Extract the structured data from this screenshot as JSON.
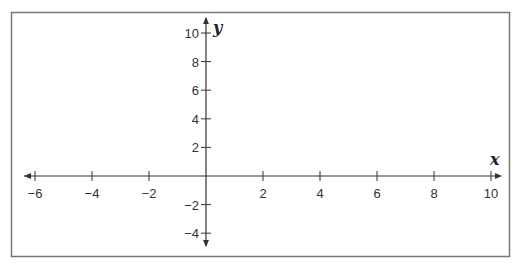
{
  "chart_data": {
    "type": "coordinate-plane",
    "title": "",
    "xlabel": "x",
    "ylabel": "y",
    "xlim": [
      -6,
      10
    ],
    "ylim": [
      -4,
      10
    ],
    "x_ticks": [
      -6,
      -4,
      -2,
      2,
      4,
      6,
      8,
      10
    ],
    "x_tick_labels": [
      "−6",
      "−4",
      "−2",
      "2",
      "4",
      "6",
      "8",
      "10"
    ],
    "y_ticks": [
      10,
      8,
      6,
      4,
      2,
      -2,
      -4
    ],
    "y_tick_labels": [
      "10",
      "8",
      "6",
      "4",
      "2",
      "−2",
      "−4"
    ],
    "grid": false,
    "arrows": [
      "left",
      "right",
      "up",
      "down"
    ],
    "series": []
  },
  "colors": {
    "axis": "#333333",
    "frame": "#777777",
    "background": "#ffffff"
  }
}
